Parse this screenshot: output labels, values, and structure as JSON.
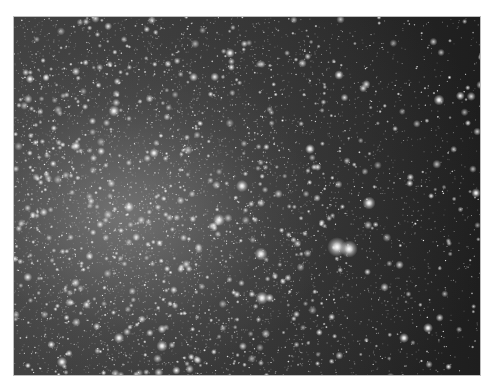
{
  "image": {
    "subject": "dense globular star cluster field",
    "description": "Grayscale astronomical image of a star cluster; dense bright core toward the left-center, sparser field toward the right with a bright double star near the lower right-center.",
    "frame": {
      "x": 13,
      "y": 16,
      "width": 468,
      "height": 360
    },
    "colors": {
      "page_background": "#ffffff",
      "sky": "#2a2a2a",
      "stars": "#ffffff"
    },
    "core_center": {
      "x": 110,
      "y": 200
    },
    "bright_stars": [
      {
        "x": 323,
        "y": 230,
        "r": 4.5
      },
      {
        "x": 335,
        "y": 232,
        "r": 4
      },
      {
        "x": 355,
        "y": 186,
        "r": 3
      },
      {
        "x": 247,
        "y": 237,
        "r": 3
      },
      {
        "x": 248,
        "y": 281,
        "r": 3
      },
      {
        "x": 228,
        "y": 169,
        "r": 2.8
      },
      {
        "x": 205,
        "y": 203,
        "r": 2.8
      },
      {
        "x": 425,
        "y": 83,
        "r": 2.5
      },
      {
        "x": 100,
        "y": 94,
        "r": 2.6
      },
      {
        "x": 148,
        "y": 329,
        "r": 2.6
      },
      {
        "x": 105,
        "y": 321,
        "r": 2.4
      },
      {
        "x": 48,
        "y": 345,
        "r": 2.4
      },
      {
        "x": 296,
        "y": 132,
        "r": 2.3
      },
      {
        "x": 325,
        "y": 58,
        "r": 2.2
      },
      {
        "x": 390,
        "y": 321,
        "r": 2.3
      },
      {
        "x": 414,
        "y": 311,
        "r": 2.3
      },
      {
        "x": 462,
        "y": 176,
        "r": 2.2
      },
      {
        "x": 216,
        "y": 36,
        "r": 2.2
      },
      {
        "x": 16,
        "y": 62,
        "r": 2
      },
      {
        "x": 62,
        "y": 129,
        "r": 2.2
      },
      {
        "x": 115,
        "y": 190,
        "r": 2.4
      },
      {
        "x": 140,
        "y": 136,
        "r": 2.2
      }
    ],
    "field_star_count": 2600,
    "random_seed": 7
  }
}
